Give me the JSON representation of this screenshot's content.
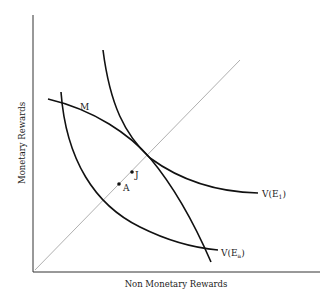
{
  "diagram": {
    "x_axis_label": "Non Monetary Rewards",
    "y_axis_label": "Monetary Rewards",
    "curves": {
      "m": {
        "label": "M"
      },
      "v_e1": {
        "label": "V(E",
        "sub": "1",
        "close": ")"
      },
      "v_ea": {
        "label": "V(E",
        "sub": "a",
        "close": ")"
      }
    },
    "points": {
      "j": {
        "label": "J"
      },
      "a": {
        "label": "A"
      }
    },
    "colors": {
      "curve": "#111111",
      "diagonal": "#b0b0b0",
      "axis": "#333333"
    }
  }
}
